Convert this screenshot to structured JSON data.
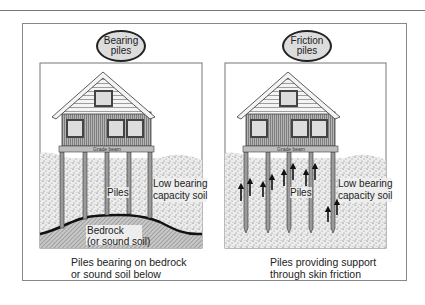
{
  "figure": {
    "panels": [
      {
        "id": "bearing",
        "bubble_line1": "Bearing",
        "bubble_line2": "piles",
        "grade_beam_label": "Grade beam",
        "piles_label": "Piles",
        "soil_label_line1": "Low bearing",
        "soil_label_line2": "capacity soil",
        "bedrock_label_line1": "Bedrock",
        "bedrock_label_line2": "(or sound soil)",
        "caption_line1": "Piles bearing on bedrock",
        "caption_line2": "or sound soil below"
      },
      {
        "id": "friction",
        "bubble_line1": "Friction",
        "bubble_line2": "piles",
        "grade_beam_label": "Grade beam",
        "piles_label": "Piles",
        "soil_label_line1": "Low bearing",
        "soil_label_line2": "capacity soil",
        "caption_line1": "Piles providing support",
        "caption_line2": "through skin friction"
      }
    ],
    "colors": {
      "line": "#222222",
      "frame": "#888888",
      "soil": "#e6e6e6",
      "bedrock": "#b0b0b0",
      "house_wall": "#9a9a9a",
      "window": "#dddddd",
      "bubble_fill": "#dcdcdc"
    }
  }
}
